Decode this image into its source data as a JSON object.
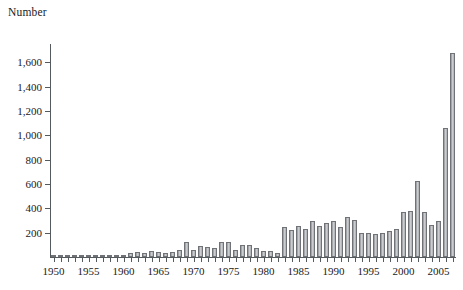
{
  "chart_data": {
    "type": "bar",
    "title": "",
    "subtitle": "",
    "ylabel": "Number",
    "xlabel": "",
    "ylim": [
      0,
      1750
    ],
    "xlim": [
      1949.5,
      2007.5
    ],
    "grid": false,
    "legend": null,
    "y_ticks": [
      200,
      400,
      600,
      800,
      1000,
      1200,
      1400,
      1600
    ],
    "y_tick_labels": [
      "200",
      "400",
      "600",
      "800",
      "1,000",
      "1,200",
      "1,400",
      "1,600"
    ],
    "x_ticks": [
      1950,
      1955,
      1960,
      1965,
      1970,
      1975,
      1980,
      1985,
      1990,
      1995,
      2000,
      2005
    ],
    "x_tick_labels": [
      "1950",
      "1955",
      "1960",
      "1965",
      "1970",
      "1975",
      "1980",
      "1985",
      "1990",
      "1995",
      "2000",
      "2005"
    ],
    "bar_fill_color": "#cfd1d3",
    "bar_edge_color": "#6f7276",
    "axis_color": "#555a5e",
    "categories": [
      "1950",
      "1951",
      "1952",
      "1953",
      "1954",
      "1955",
      "1956",
      "1957",
      "1958",
      "1959",
      "1960",
      "1961",
      "1962",
      "1963",
      "1964",
      "1965",
      "1966",
      "1967",
      "1968",
      "1969",
      "1970",
      "1971",
      "1972",
      "1973",
      "1974",
      "1975",
      "1976",
      "1977",
      "1978",
      "1979",
      "1980",
      "1981",
      "1982",
      "1983",
      "1984",
      "1985",
      "1986",
      "1987",
      "1988",
      "1989",
      "1990",
      "1991",
      "1992",
      "1993",
      "1994",
      "1995",
      "1996",
      "1997",
      "1998",
      "1999",
      "2000",
      "2001",
      "2002",
      "2003",
      "2004",
      "2005",
      "2006",
      "2007"
    ],
    "values": [
      8,
      6,
      7,
      6,
      10,
      8,
      7,
      9,
      12,
      14,
      20,
      36,
      40,
      34,
      48,
      44,
      30,
      38,
      55,
      120,
      60,
      88,
      80,
      74,
      126,
      122,
      56,
      98,
      102,
      74,
      52,
      48,
      36,
      246,
      226,
      252,
      234,
      300,
      252,
      276,
      300,
      248,
      328,
      306,
      200,
      196,
      186,
      196,
      214,
      230,
      366,
      382,
      628,
      370,
      260,
      300,
      1060,
      1680
    ]
  }
}
